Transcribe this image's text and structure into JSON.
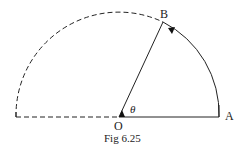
{
  "figure": {
    "caption": "Fig 6.25",
    "points": {
      "origin": "O",
      "a": "A",
      "b": "B"
    },
    "angle_label": "θ",
    "colors": {
      "line": "#222222",
      "background": "#ffffff"
    }
  }
}
